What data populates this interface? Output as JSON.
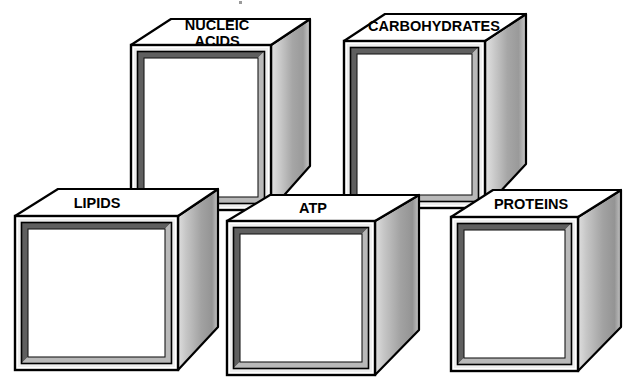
{
  "diagram": {
    "background_color": "#ffffff",
    "ink_color": "#000000",
    "face_colors": {
      "front_face": "#ffffff",
      "top_face": "#ffffff",
      "side_light": "#d9d9d9",
      "side_mid": "#a8a8a8",
      "side_dark": "#8e8e8e",
      "bevel_light": "#f2f2f2",
      "bevel_mid": "#b5b5b5",
      "bevel_dark": "#6e6e6e",
      "outline": "#000000"
    },
    "boxes": [
      {
        "id": "nucleic-acids",
        "label": "NUCLEIC\nACIDS",
        "label_line1": "NUCLEIC",
        "label_line2": "ACIDS",
        "row": "back",
        "order": 1,
        "front_face_content": "",
        "label_font_size": 15
      },
      {
        "id": "carbohydrates",
        "label": "CARBOHYDRATES",
        "label_line1": "CARBOHYDRATES",
        "label_line2": "",
        "row": "back",
        "order": 2,
        "front_face_content": "",
        "label_font_size": 15
      },
      {
        "id": "lipids",
        "label": "LIPIDS",
        "label_line1": "LIPIDS",
        "label_line2": "",
        "row": "front",
        "order": 3,
        "front_face_content": "",
        "label_font_size": 15
      },
      {
        "id": "atp",
        "label": "ATP",
        "label_line1": "ATP",
        "label_line2": "",
        "row": "front",
        "order": 4,
        "front_face_content": "",
        "label_font_size": 15
      },
      {
        "id": "proteins",
        "label": "PROTEINS",
        "label_line1": "PROTEINS",
        "label_line2": "",
        "row": "front",
        "order": 5,
        "front_face_content": "",
        "label_font_size": 15
      }
    ]
  }
}
